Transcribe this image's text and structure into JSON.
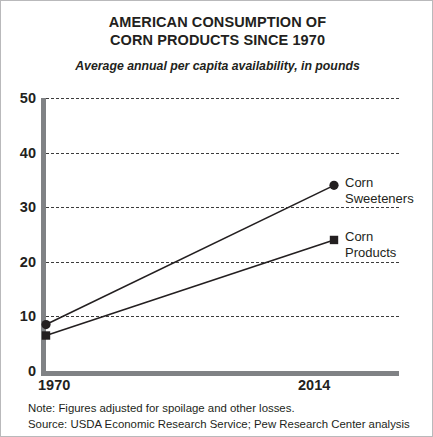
{
  "chart_data": {
    "type": "line",
    "title": "AMERICAN CONSUMPTION OF CORN PRODUCTS SINCE 1970",
    "title_lines": [
      "AMERICAN CONSUMPTION OF",
      "CORN PRODUCTS SINCE 1970"
    ],
    "subtitle": "Average annual per capita availability, in pounds",
    "xlabel": "",
    "ylabel": "",
    "x": [
      1970,
      2014
    ],
    "xlim": [
      1970,
      2014
    ],
    "xticks": [
      "1970",
      "2014"
    ],
    "ylim": [
      0,
      50
    ],
    "yticks": [
      0,
      10,
      20,
      30,
      40,
      50
    ],
    "ytick_labels": [
      "0",
      "10",
      "20",
      "30",
      "40",
      "50"
    ],
    "grid": true,
    "grid_style": "dashed-horizontal",
    "legend_position": "right-inline-labels",
    "series": [
      {
        "name": "Corn Sweeteners",
        "name_lines": [
          "Corn",
          "Sweeteners"
        ],
        "values": [
          8.5,
          34
        ],
        "marker": "circle",
        "color": "#231f20"
      },
      {
        "name": "Corn Products",
        "name_lines": [
          "Corn",
          "Products"
        ],
        "values": [
          6.5,
          24
        ],
        "marker": "square",
        "color": "#231f20"
      }
    ],
    "notes": [
      "Note: Figures adjusted for spoilage and other losses.",
      "Source: USDA Economic Research Service; Pew Research Center analysis"
    ]
  },
  "colors": {
    "ink": "#231f20",
    "axis": "#808285",
    "grid": "#3c3c3c",
    "border": "#b9b9bb",
    "background": "#ffffff"
  }
}
